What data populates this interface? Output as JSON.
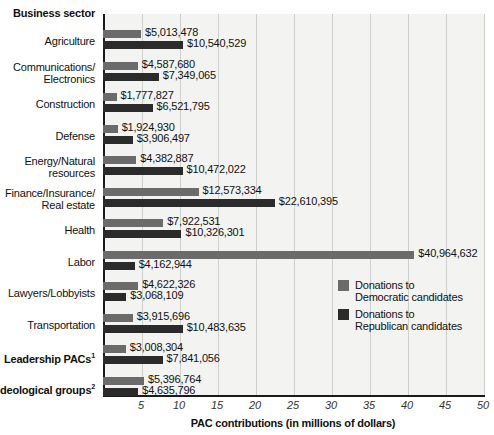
{
  "chart": {
    "category_header": "Business sector",
    "axis_title": "PAC contributions (in millions of dollars)",
    "legend": [
      {
        "key": "dem",
        "line1": "Donations to",
        "line2": "Democratic candidates",
        "color": "#6b6b6b"
      },
      {
        "key": "rep",
        "line1": "Donations to",
        "line2": "Republican candidates",
        "color": "#2b2b2b"
      }
    ]
  },
  "chart_data": {
    "type": "bar",
    "orientation": "horizontal",
    "title": "",
    "xlabel": "PAC contributions (in millions of dollars)",
    "ylabel": "Business sector",
    "xlim": [
      0,
      50
    ],
    "xticks": [
      5,
      10,
      15,
      20,
      25,
      30,
      35,
      40,
      45,
      50
    ],
    "grid": "vertical",
    "legend_position": "inside-right",
    "categories": [
      "Agriculture",
      "Communications/ Electronics",
      "Construction",
      "Defense",
      "Energy/Natural resources",
      "Finance/Insurance/ Real estate",
      "Health",
      "Labor",
      "Lawyers/Lobbyists",
      "Transportation",
      "Leadership PACs",
      "Ideological groups"
    ],
    "series": [
      {
        "name": "Donations to Democratic candidates",
        "color": "#6b6b6b",
        "values": [
          5013478,
          4587680,
          1777827,
          1924930,
          4382887,
          12573334,
          7922531,
          40964632,
          4622326,
          3915696,
          3008304,
          5396764
        ],
        "labels": [
          "$5,013,478",
          "$4,587,680",
          "$1,777,827",
          "$1,924,930",
          "$4,382,887",
          "$12,573,334",
          "$7,922,531",
          "$40,964,632",
          "$4,622,326",
          "$3,915,696",
          "$3,008,304",
          "$5,396,764"
        ]
      },
      {
        "name": "Donations to Republican candidates",
        "color": "#2b2b2b",
        "values": [
          10540529,
          7349065,
          6521795,
          3906497,
          10472022,
          22610395,
          10326301,
          4162944,
          3068109,
          10483635,
          7841056,
          4635796
        ],
        "labels": [
          "$10,540,529",
          "$7,349,065",
          "$6,521,795",
          "$3,906,497",
          "$10,472,022",
          "$22,610,395",
          "$10,326,301",
          "$4,162,944",
          "$3,068,109",
          "$10,483,635",
          "$7,841,056",
          "$4,635,796"
        ]
      }
    ]
  },
  "rows": [
    {
      "label_line1": "Agriculture",
      "label_line2": "",
      "bold": false,
      "sup": "",
      "dem_label": "$5,013,478",
      "rep_label": "$10,540,529",
      "dem_value": 5013478,
      "rep_value": 10540529
    },
    {
      "label_line1": "Communications/",
      "label_line2": "Electronics",
      "bold": false,
      "sup": "",
      "dem_label": "$4,587,680",
      "rep_label": "$7,349,065",
      "dem_value": 4587680,
      "rep_value": 7349065
    },
    {
      "label_line1": "Construction",
      "label_line2": "",
      "bold": false,
      "sup": "",
      "dem_label": "$1,777,827",
      "rep_label": "$6,521,795",
      "dem_value": 1777827,
      "rep_value": 6521795
    },
    {
      "label_line1": "Defense",
      "label_line2": "",
      "bold": false,
      "sup": "",
      "dem_label": "$1,924,930",
      "rep_label": "$3,906,497",
      "dem_value": 1924930,
      "rep_value": 3906497
    },
    {
      "label_line1": "Energy/Natural",
      "label_line2": "resources",
      "bold": false,
      "sup": "",
      "dem_label": "$4,382,887",
      "rep_label": "$10,472,022",
      "dem_value": 4382887,
      "rep_value": 10472022
    },
    {
      "label_line1": "Finance/Insurance/",
      "label_line2": "Real estate",
      "bold": false,
      "sup": "",
      "dem_label": "$12,573,334",
      "rep_label": "$22,610,395",
      "dem_value": 12573334,
      "rep_value": 22610395
    },
    {
      "label_line1": "Health",
      "label_line2": "",
      "bold": false,
      "sup": "",
      "dem_label": "$7,922,531",
      "rep_label": "$10,326,301",
      "dem_value": 7922531,
      "rep_value": 10326301
    },
    {
      "label_line1": "Labor",
      "label_line2": "",
      "bold": false,
      "sup": "",
      "dem_label": "$40,964,632",
      "rep_label": "$4,162,944",
      "dem_value": 40964632,
      "rep_value": 4162944
    },
    {
      "label_line1": "Lawyers/Lobbyists",
      "label_line2": "",
      "bold": false,
      "sup": "",
      "dem_label": "$4,622,326",
      "rep_label": "$3,068,109",
      "dem_value": 4622326,
      "rep_value": 3068109
    },
    {
      "label_line1": "Transportation",
      "label_line2": "",
      "bold": false,
      "sup": "",
      "dem_label": "$3,915,696",
      "rep_label": "$10,483,635",
      "dem_value": 3915696,
      "rep_value": 10483635
    },
    {
      "label_line1": "Leadership PACs",
      "label_line2": "",
      "bold": true,
      "sup": "1",
      "dem_label": "$3,008,304",
      "rep_label": "$7,841,056",
      "dem_value": 3008304,
      "rep_value": 7841056
    },
    {
      "label_line1": "Ideological groups",
      "label_line2": "",
      "bold": true,
      "sup": "2",
      "dem_label": "$5,396,764",
      "rep_label": "$4,635,796",
      "dem_value": 5396764,
      "rep_value": 4635796
    }
  ]
}
